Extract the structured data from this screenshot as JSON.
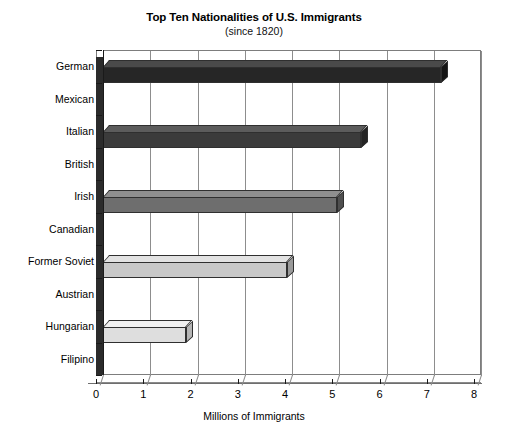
{
  "chart_data": {
    "type": "bar",
    "orientation": "horizontal",
    "title": "Top Ten Nationalities of U.S. Immigrants",
    "subtitle": "(since 1820)",
    "xlabel": "Millions of Immigrants",
    "ylabel": "",
    "xlim": [
      0,
      8
    ],
    "xticks": [
      "0",
      "1",
      "2",
      "3",
      "4",
      "5",
      "6",
      "7",
      "8"
    ],
    "grid": "vertical",
    "legend": "none",
    "categories": [
      "German",
      "Mexican",
      "Italian",
      "British",
      "Irish",
      "Canadian",
      "Former Soviet",
      "Austrian",
      "Hungarian",
      "Filipino"
    ],
    "values": [
      7.15,
      0,
      5.45,
      0,
      4.95,
      0,
      3.9,
      0,
      1.75,
      0
    ],
    "bar_colors": [
      "#262626",
      "#262626",
      "#3b3b3b",
      "#3b3b3b",
      "#6e6e6e",
      "#6e6e6e",
      "#c8c8c8",
      "#c8c8c8",
      "#dedede",
      "#dedede"
    ],
    "bar_top_colors": [
      "#4a4a4a",
      "#4a4a4a",
      "#5c5c5c",
      "#5c5c5c",
      "#8f8f8f",
      "#8f8f8f",
      "#e2e2e2",
      "#e2e2e2",
      "#f0f0f0",
      "#f0f0f0"
    ],
    "bar_cap_colors": [
      "#151515",
      "#151515",
      "#242424",
      "#242424",
      "#4f4f4f",
      "#4f4f4f",
      "#9a9a9a",
      "#9a9a9a",
      "#b5b5b5",
      "#b5b5b5"
    ]
  },
  "colors": {
    "background": "#ffffff",
    "axis": "#1a1a1a",
    "grid": "#8d8d8d",
    "frame": "#7d7d7d",
    "text": "#000000"
  }
}
